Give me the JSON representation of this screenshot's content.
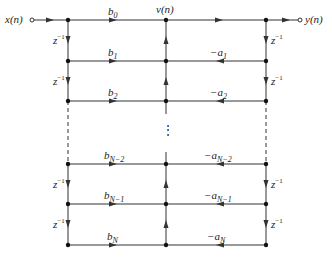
{
  "diagram": {
    "type": "signal-flow-graph",
    "input_label": "x(n)",
    "output_label": "y(n)",
    "center_node_label": "v(n)",
    "delay_label": "z",
    "delay_exp": "−1",
    "ellipsis": "⋮",
    "feedforward": [
      {
        "base": "b",
        "sub": "0"
      },
      {
        "base": "b",
        "sub": "1"
      },
      {
        "base": "b",
        "sub": "2"
      },
      {
        "base": "b",
        "sub": "N−2"
      },
      {
        "base": "b",
        "sub": "N−1"
      },
      {
        "base": "b",
        "sub": "N"
      }
    ],
    "feedback": [
      {
        "base": "−a",
        "sub": "1"
      },
      {
        "base": "−a",
        "sub": "2"
      },
      {
        "base": "−a",
        "sub": "N−2"
      },
      {
        "base": "−a",
        "sub": "N−1"
      },
      {
        "base": "−a",
        "sub": "N"
      }
    ],
    "line_color": "#333333"
  }
}
